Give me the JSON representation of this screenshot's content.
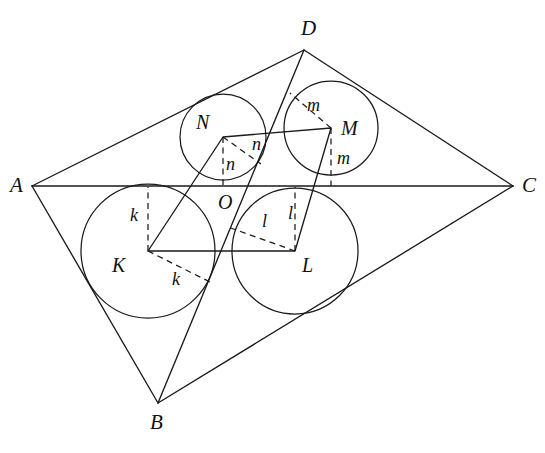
{
  "figure": {
    "background_color": "#ffffff",
    "stroke_color": "#1a1a1a",
    "width": 545,
    "height": 453,
    "vertices": [
      {
        "id": "A",
        "label": "A",
        "x": 32,
        "y": 186,
        "label_x": 10,
        "label_y": 175
      },
      {
        "id": "B",
        "label": "B",
        "x": 158,
        "y": 403,
        "label_x": 150,
        "label_y": 412
      },
      {
        "id": "C",
        "label": "C",
        "x": 513,
        "y": 186,
        "label_x": 522,
        "label_y": 175
      },
      {
        "id": "D",
        "label": "D",
        "x": 304,
        "y": 50,
        "label_x": 301,
        "label_y": 18
      }
    ],
    "centers": [
      {
        "id": "K",
        "label": "K",
        "x": 148,
        "y": 251,
        "radius": 67,
        "label_x": 112,
        "label_y": 255
      },
      {
        "id": "L",
        "label": "L",
        "x": 295,
        "y": 251,
        "radius": 63,
        "label_x": 302,
        "label_y": 255
      },
      {
        "id": "M",
        "label": "M",
        "x": 331,
        "y": 128,
        "radius": 47,
        "label_x": 341,
        "label_y": 118
      },
      {
        "id": "N",
        "label": "N",
        "x": 223,
        "y": 137,
        "radius": 43,
        "label_x": 196,
        "label_y": 112
      }
    ],
    "intersection_point": {
      "id": "O",
      "label": "O",
      "x": 227,
      "y": 186,
      "label_x": 218,
      "label_y": 192
    },
    "outer_edges": [
      {
        "name": "edge-AD",
        "from": "A",
        "to": "D"
      },
      {
        "name": "edge-DC",
        "from": "D",
        "to": "C"
      },
      {
        "name": "edge-CB",
        "from": "C",
        "to": "B"
      },
      {
        "name": "edge-BA",
        "from": "B",
        "to": "A"
      }
    ],
    "diagonals": [
      {
        "name": "diagonal-AC",
        "from": "A",
        "to": "C"
      },
      {
        "name": "diagonal-BD",
        "from": "B",
        "to": "D"
      }
    ],
    "inner_quadrilateral": {
      "name": "quadrilateral-KLMN",
      "points": "148,251 295,251 331,128 223,137"
    },
    "radius_labels": [
      {
        "id": "k-vertical",
        "text": "k",
        "x": 130,
        "y": 206
      },
      {
        "id": "k-diagonal",
        "text": "k",
        "x": 172,
        "y": 270
      },
      {
        "id": "l-diagonal",
        "text": "l",
        "x": 262,
        "y": 212
      },
      {
        "id": "l-vertical",
        "text": "l",
        "x": 288,
        "y": 204
      },
      {
        "id": "m-diagonal",
        "text": "m",
        "x": 307,
        "y": 96
      },
      {
        "id": "m-vertical",
        "text": "m",
        "x": 337,
        "y": 149
      },
      {
        "id": "n-diagonal",
        "text": "n",
        "x": 252,
        "y": 135
      },
      {
        "id": "n-vertical",
        "text": "n",
        "x": 226,
        "y": 155
      }
    ],
    "dashed_segments": [
      {
        "name": "perp-K-to-AC",
        "x1": 148,
        "y1": 251,
        "x2": 148,
        "y2": 187
      },
      {
        "name": "perp-K-to-BC",
        "x1": 148,
        "y1": 251,
        "x2": 212,
        "y2": 283
      },
      {
        "name": "perp-L-to-AC",
        "x1": 295,
        "y1": 251,
        "x2": 295,
        "y2": 187
      },
      {
        "name": "perp-L-to-BD",
        "x1": 295,
        "y1": 251,
        "x2": 228,
        "y2": 227
      },
      {
        "name": "perp-M-to-AC",
        "x1": 331,
        "y1": 128,
        "x2": 331,
        "y2": 186
      },
      {
        "name": "perp-M-to-BD",
        "x1": 331,
        "y1": 128,
        "x2": 290,
        "y2": 93
      },
      {
        "name": "perp-N-to-AC",
        "x1": 223,
        "y1": 137,
        "x2": 223,
        "y2": 186
      },
      {
        "name": "perp-N-to-BD",
        "x1": 223,
        "y1": 137,
        "x2": 261,
        "y2": 164
      }
    ]
  }
}
